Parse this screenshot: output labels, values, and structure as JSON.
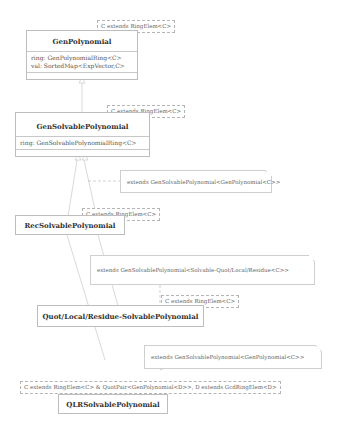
{
  "classes": {
    "gen_polynomial": {
      "name": "GenPolynomial",
      "attributes": [
        "ring: GenPolynomialRing<C>",
        "val: SortedMap<ExpVector,C>"
      ],
      "type_param": "C extends RingElem<C>"
    },
    "gen_solvable_polynomial": {
      "name": "GenSolvablePolynomial",
      "attributes": [
        "ring: GenSolvablePolynomialRing<C>"
      ],
      "type_param": "C extends RingElem<C>"
    },
    "rec_solvable_polynomial": {
      "name": "RecSolvablePolynomial",
      "type_param": "C extends RingElem<C>"
    },
    "qlr_solvable_polynomial_generic": {
      "name": "Quot/Local/Residue-SolvablePolynomial",
      "type_param": "C extends RingElem<C>"
    },
    "qlr_solvable_polynomial": {
      "name": "QLRSolvablePolynomial",
      "type_param": "C extends RingElem<C> & QuotPair<GenPolynomial<D>>, D extends GcdRingElem<D>"
    }
  },
  "notes": {
    "rec_extends": "extends GenSolvablePolynomial<GenPolynomial<C>>",
    "qlr_generic_extends": "extends GenSolvablePolynomial<Solvable-Quot/Local/Residue<C>>",
    "qlr_extends": "extends GenSolvablePolynomial<GenPolynomial<C>>"
  },
  "colors": {
    "line": "#c8c8c8",
    "border": "#bdbdbd",
    "text": "#555555"
  }
}
